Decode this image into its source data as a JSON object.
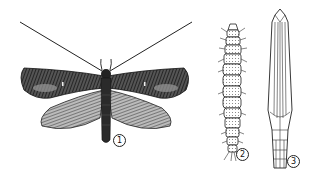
{
  "figure": {
    "type": "scientific-illustration",
    "panels": [
      {
        "id": 1,
        "label": "1",
        "name": "adult-moth"
      },
      {
        "id": 2,
        "label": "2",
        "name": "larva"
      },
      {
        "id": 3,
        "label": "3",
        "name": "pupa"
      }
    ],
    "colors": {
      "ink": "#1a1a1a",
      "background": "#ffffff",
      "wing_dark": "#3a3a3a",
      "wing_light": "#8a8a8a"
    }
  }
}
